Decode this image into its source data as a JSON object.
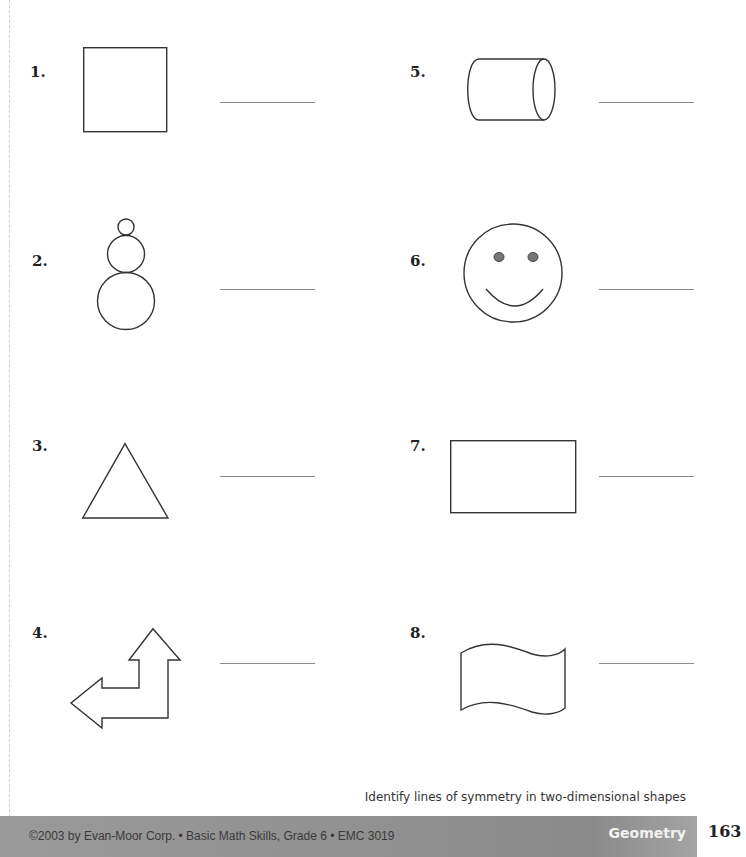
{
  "worksheet": {
    "items": [
      {
        "number": "1.",
        "shape": "square",
        "icon": "square-icon",
        "answer": ""
      },
      {
        "number": "2.",
        "shape": "snowman (three stacked circles)",
        "icon": "snowman-icon",
        "answer": ""
      },
      {
        "number": "3.",
        "shape": "triangle",
        "icon": "triangle-icon",
        "answer": ""
      },
      {
        "number": "4.",
        "shape": "bent double arrow",
        "icon": "bent-arrow-icon",
        "answer": ""
      },
      {
        "number": "5.",
        "shape": "cylinder",
        "icon": "cylinder-icon",
        "answer": ""
      },
      {
        "number": "6.",
        "shape": "smiley face",
        "icon": "smiley-face-icon",
        "answer": ""
      },
      {
        "number": "7.",
        "shape": "rectangle",
        "icon": "rectangle-icon",
        "answer": ""
      },
      {
        "number": "8.",
        "shape": "wavy flag",
        "icon": "flag-icon",
        "answer": ""
      }
    ]
  },
  "footer": {
    "caption": "Identify lines of symmetry in two-dimensional shapes",
    "copyright": "©2003 by Evan-Moor Corp. • Basic Math Skills, Grade 6 • EMC 3019",
    "section": "Geometry",
    "page_number": "163"
  },
  "colors": {
    "footer_bar": "#8f8f8f",
    "section_text": "#f2f2f2",
    "answer_line": "#8c8c8c",
    "eye_fill": "#777777"
  }
}
